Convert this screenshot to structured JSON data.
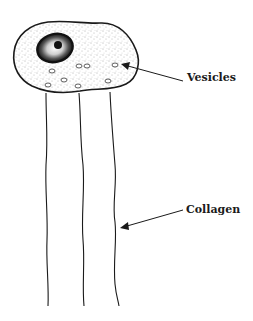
{
  "diagram": {
    "labels": {
      "vesicles": "Vesicles",
      "collagen": "Collagen"
    },
    "parts": [
      "cell-body",
      "nucleus",
      "nucleolus",
      "vesicles",
      "collagen-fibers"
    ],
    "colors": {
      "ink": "#1a1a1a",
      "stipple": "#555555",
      "background": "#ffffff"
    }
  }
}
